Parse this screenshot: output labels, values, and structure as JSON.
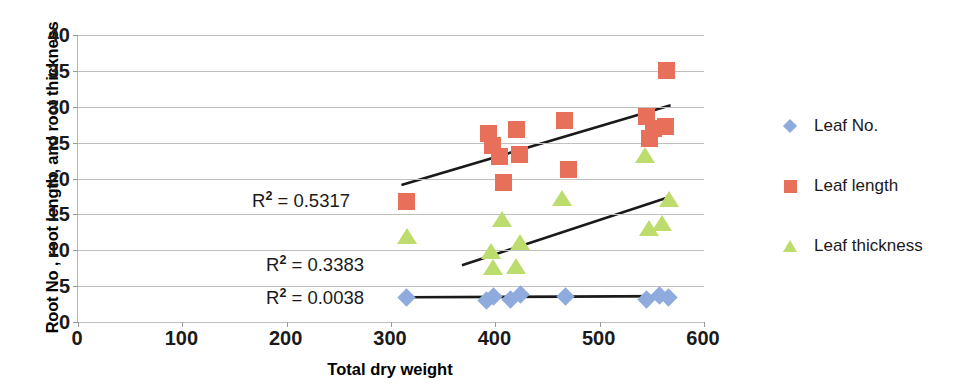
{
  "chart_data": {
    "type": "scatter",
    "title": "",
    "xlabel": "Total dry weight",
    "ylabel": "Root No , root length, and root thickness",
    "xlim": [
      0,
      600
    ],
    "ylim": [
      0,
      40
    ],
    "xticks": [
      0,
      100,
      200,
      300,
      400,
      500,
      600
    ],
    "yticks": [
      0,
      5,
      10,
      15,
      20,
      25,
      30,
      35,
      40
    ],
    "grid": true,
    "legend_position": "right",
    "series": [
      {
        "name": "Leaf No.",
        "marker": "diamond",
        "color": "#8FAADC",
        "points": [
          [
            315,
            3.4
          ],
          [
            392,
            3.0
          ],
          [
            398,
            3.5
          ],
          [
            415,
            3.2
          ],
          [
            424,
            3.9
          ],
          [
            467,
            3.5
          ],
          [
            545,
            3.2
          ],
          [
            557,
            3.7
          ],
          [
            566,
            3.4
          ]
        ],
        "trendline": {
          "x0": 315,
          "y0": 3.45,
          "x1": 572,
          "y1": 3.6
        },
        "r2_label": "R² = 0.0038",
        "r2_value": 0.0038
      },
      {
        "name": "Leaf length",
        "marker": "square",
        "color": "#E8705A",
        "points": [
          [
            315,
            16.8
          ],
          [
            393,
            26.3
          ],
          [
            397,
            24.6
          ],
          [
            404,
            23.1
          ],
          [
            408,
            19.5
          ],
          [
            420,
            26.8
          ],
          [
            423,
            23.3
          ],
          [
            466,
            28.1
          ],
          [
            470,
            21.3
          ],
          [
            545,
            28.6
          ],
          [
            552,
            26.9
          ],
          [
            548,
            25.6
          ],
          [
            563,
            27.2
          ],
          [
            564,
            35.0
          ]
        ],
        "trendline": {
          "x0": 310,
          "y0": 19.1,
          "x1": 568,
          "y1": 30.2
        },
        "r2_label": "R² = 0.5317",
        "r2_value": 0.5317
      },
      {
        "name": "Leaf thickness",
        "marker": "triangle",
        "color": "#BDDC6E",
        "points": [
          [
            315,
            12.0
          ],
          [
            396,
            9.9
          ],
          [
            398,
            7.6
          ],
          [
            406,
            14.3
          ],
          [
            420,
            7.8
          ],
          [
            424,
            11.1
          ],
          [
            464,
            17.3
          ],
          [
            543,
            23.3
          ],
          [
            547,
            13.1
          ],
          [
            560,
            13.8
          ],
          [
            566,
            17.1
          ]
        ],
        "trendline": {
          "x0": 368,
          "y0": 7.9,
          "x1": 566,
          "y1": 17.4
        },
        "r2_label": "R² = 0.3383",
        "r2_value": 0.3383
      }
    ],
    "annotations": [
      {
        "text_prefix": "R",
        "text_sup": "2",
        "text_rest": " = 0.5317",
        "x_px": 252,
        "y_px": 189
      },
      {
        "text_prefix": "R",
        "text_sup": "2",
        "text_rest": " = 0.3383",
        "x_px": 266,
        "y_px": 253
      },
      {
        "text_prefix": "R",
        "text_sup": "2",
        "text_rest": " = 0.0038",
        "x_px": 266,
        "y_px": 286
      }
    ]
  },
  "legend": {
    "items": [
      {
        "label": "Leaf No.",
        "marker": "diamond",
        "color": "#8FAADC"
      },
      {
        "label": "Leaf length",
        "marker": "square",
        "color": "#E8705A"
      },
      {
        "label": "Leaf thickness",
        "marker": "triangle",
        "color": "#BDDC6E"
      }
    ]
  },
  "axes": {
    "x_title": "Total dry weight",
    "y_title": "Root No , root length, and root thickness",
    "x_tick_labels": [
      "0",
      "100",
      "200",
      "300",
      "400",
      "500",
      "600"
    ],
    "y_tick_labels": [
      "0",
      "5",
      "10",
      "15",
      "20",
      "25",
      "30",
      "35",
      "40"
    ]
  },
  "style": {
    "gridline_color": "#bfbfbf",
    "axis_color": "#9a9a9a",
    "trendline_color": "#1a1a1a",
    "text_color": "#1a1a1a"
  }
}
